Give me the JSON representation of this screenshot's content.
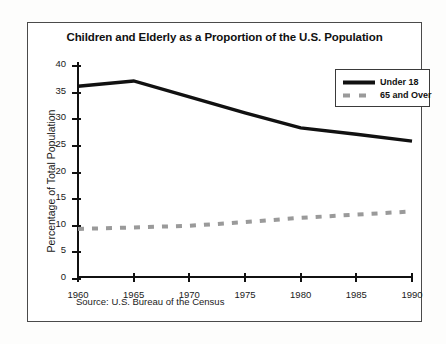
{
  "figure": {
    "title": "Children and Elderly as a Proportion of the U.S. Population",
    "source_note": "Source: U.S. Bureau of the Census",
    "y_axis_title": "Percentage of Total Population"
  },
  "legend": {
    "position": "top-right",
    "entries": [
      {
        "label": "Under 18",
        "color": "#111111",
        "style": "solid"
      },
      {
        "label": "65 and Over",
        "color": "#9a9a9a",
        "style": "dashed"
      }
    ]
  },
  "colors": {
    "under18": "#111111",
    "over65": "#9a9a9a",
    "axis": "#111111",
    "frame": "#4a4a4a",
    "page": "#fdfdfc"
  },
  "chart_data": {
    "type": "line",
    "title": "Children and Elderly as a Proportion of the U.S. Population",
    "xlabel": "",
    "ylabel": "Percentage of Total Population",
    "x": [
      1960,
      1965,
      1970,
      1975,
      1980,
      1985,
      1990
    ],
    "categories": [
      "1960",
      "1965",
      "1970",
      "1975",
      "1980",
      "1985",
      "1990"
    ],
    "xlim": [
      1960,
      1990
    ],
    "ylim": [
      0,
      40
    ],
    "yticks": [
      0,
      5,
      10,
      15,
      20,
      25,
      30,
      35,
      40
    ],
    "ytick_labels": [
      "0",
      "5",
      "10",
      "15",
      "20",
      "25",
      "30",
      "35",
      "40"
    ],
    "xticks": [
      1960,
      1965,
      1970,
      1975,
      1980,
      1985,
      1990
    ],
    "xtick_labels": [
      "1960",
      "1965",
      "1970",
      "1975",
      "1980",
      "1985",
      "1990"
    ],
    "grid": false,
    "legend_position": "top-right",
    "series": [
      {
        "name": "Under 18",
        "color": "#111111",
        "style": "solid",
        "values": [
          36.0,
          37.0,
          34.0,
          31.0,
          28.2,
          27.0,
          25.7
        ]
      },
      {
        "name": "65 and Over",
        "color": "#9a9a9a",
        "style": "dashed",
        "values": [
          9.2,
          9.5,
          9.8,
          10.5,
          11.3,
          11.9,
          12.5
        ]
      }
    ],
    "annotations": [
      "Source: U.S. Bureau of the Census"
    ]
  }
}
